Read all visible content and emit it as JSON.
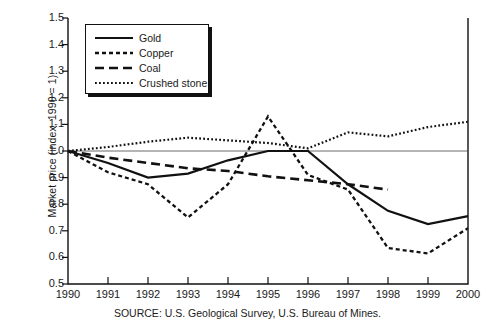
{
  "chart_data": {
    "type": "line",
    "title": "",
    "xlabel": "",
    "ylabel": "Market price (index, 1990 = 1)",
    "xlim": [
      1990,
      2000
    ],
    "ylim": [
      0.5,
      1.5
    ],
    "grid": false,
    "legend_position": "upper-left",
    "xticks": [
      "1990",
      "1991",
      "1992",
      "1993",
      "1994",
      "1995",
      "1996",
      "1997",
      "1998",
      "1999",
      "2000"
    ],
    "yticks": [
      "0.5",
      "0.6",
      "0.7",
      "0.8",
      "0.9",
      "1.0",
      "1.1",
      "1.2",
      "1.3",
      "1.4",
      "1.5"
    ],
    "x": [
      1990,
      1991,
      1992,
      1993,
      1994,
      1995,
      1996,
      1997,
      1998,
      1999,
      2000
    ],
    "series": [
      {
        "name": "Gold",
        "style": "solid",
        "color": "#111111",
        "values": [
          1.0,
          0.955,
          0.9,
          0.915,
          0.965,
          1.0,
          1.0,
          0.875,
          0.775,
          0.725,
          0.755
        ]
      },
      {
        "name": "Copper",
        "style": "dashed-short",
        "color": "#111111",
        "values": [
          1.0,
          0.92,
          0.875,
          0.75,
          0.875,
          1.13,
          0.91,
          0.855,
          0.635,
          0.615,
          0.71
        ]
      },
      {
        "name": "Coal",
        "style": "dashed-long",
        "color": "#111111",
        "values": [
          1.0,
          0.975,
          0.955,
          0.935,
          0.925,
          0.905,
          0.89,
          0.875,
          0.855,
          null,
          null
        ]
      },
      {
        "name": "Crushed stone",
        "style": "dotted",
        "color": "#111111",
        "values": [
          1.0,
          1.015,
          1.035,
          1.05,
          1.04,
          1.03,
          1.01,
          1.07,
          1.055,
          1.09,
          1.11
        ]
      }
    ],
    "annotations": [
      {
        "name": "baseline",
        "y": 1.0,
        "description": "horizontal reference line at index = 1"
      }
    ],
    "source": "SOURCE:  U.S. Geological Survey, U.S. Bureau of Mines."
  },
  "legend": {
    "entries": [
      {
        "label": "Gold"
      },
      {
        "label": "Copper"
      },
      {
        "label": "Coal"
      },
      {
        "label": "Crushed stone"
      }
    ]
  }
}
